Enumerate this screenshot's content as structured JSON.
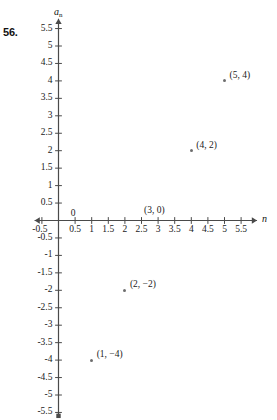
{
  "problem": {
    "number": "56."
  },
  "axes": {
    "x_name": "n",
    "y_name_base": "a",
    "y_name_sub": "n",
    "x_ticks": [
      "-0.5",
      "0",
      "0.5",
      "1",
      "1.5",
      "2",
      "2.5",
      "3",
      "3.5",
      "4",
      "4.5",
      "5",
      "5.5"
    ],
    "x_tick_values": [
      -0.5,
      0,
      0.5,
      1,
      1.5,
      2,
      2.5,
      3,
      3.5,
      4,
      4.5,
      5,
      5.5
    ],
    "y_ticks": [
      "5.5",
      "5",
      "4.5",
      "4",
      "3.5",
      "3",
      "2.5",
      "2",
      "1.5",
      "1",
      "0.5",
      "-0.5",
      "-1",
      "-1.5",
      "-2",
      "-2.5",
      "-3",
      "-3.5",
      "-4",
      "-4.5",
      "-5",
      "-5.5"
    ],
    "y_tick_values": [
      5.5,
      5,
      4.5,
      4,
      3.5,
      3,
      2.5,
      2,
      1.5,
      1,
      0.5,
      -0.5,
      -1,
      -1.5,
      -2,
      -2.5,
      -3,
      -3.5,
      -4,
      -4.5,
      -5,
      -5.5
    ],
    "x_range": [
      -0.5,
      5.5
    ],
    "y_range": [
      -5.5,
      5.5
    ],
    "axis_color": "#4a4a4a"
  },
  "chart_data": {
    "type": "scatter",
    "title": "",
    "xlabel": "n",
    "ylabel": "a_n",
    "xlim": [
      -0.5,
      5.5
    ],
    "ylim": [
      -5.5,
      5.5
    ],
    "grid": false,
    "legend": false,
    "x": [
      1,
      2,
      3,
      4,
      5
    ],
    "y": [
      -4,
      -2,
      0,
      2,
      4
    ],
    "point_color": "#6e6e6e",
    "points": [
      {
        "x": 1,
        "y": -4,
        "label": "(1, −4)",
        "label_dx": 5,
        "label_dy": -11
      },
      {
        "x": 2,
        "y": -2,
        "label": "(2, −2)",
        "label_dx": 5,
        "label_dy": -11
      },
      {
        "x": 3,
        "y": 0,
        "label": "(3, 0)",
        "label_dx": -14,
        "label_dy": -16
      },
      {
        "x": 4,
        "y": 2,
        "label": "(4, 2)",
        "label_dx": 5,
        "label_dy": -11
      },
      {
        "x": 5,
        "y": 4,
        "label": "(5, 4)",
        "label_dx": 5,
        "label_dy": -11
      }
    ]
  }
}
